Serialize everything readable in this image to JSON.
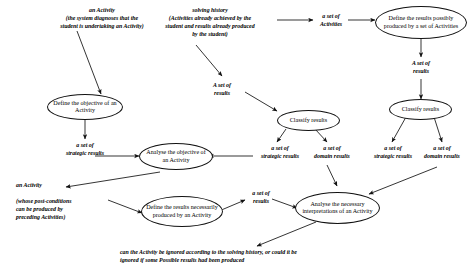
{
  "diagram": {
    "type": "flow-diagram",
    "stroke_color": "#111111",
    "background_color": "#ffffff",
    "nodes": [
      {
        "id": "define-objective",
        "label": "Define the objective\nof an Activity"
      },
      {
        "id": "define-possible-results",
        "label": "Define the results\npossibly produced by a\nset of Activities"
      },
      {
        "id": "classify-results-left",
        "label": "Classify results"
      },
      {
        "id": "classify-results-right",
        "label": "Classify results"
      },
      {
        "id": "analyse-objective",
        "label": "Analyse the objective\nof an Activity"
      },
      {
        "id": "define-necessary-results",
        "label": "Define the results\nnecessarily produced by\nan Activity"
      },
      {
        "id": "analyse-interpretations",
        "label": "Analyse the necessary\ninterpretations of an\nActivity"
      }
    ],
    "labels": [
      {
        "id": "an-activity-top",
        "text": "an Activity\n(the system diagnoses that the\nstudent is undertaking an Activity)"
      },
      {
        "id": "solving-history",
        "text": "solving history\n(Activities already achieved by the\nstudent and results already produced\nby the student)"
      },
      {
        "id": "a-set-of-activities",
        "text": "a set of\nActivities"
      },
      {
        "id": "a-set-of-results-mid",
        "text": "A set of\nresults"
      },
      {
        "id": "a-set-of-results-right",
        "text": "A set of\nresults"
      },
      {
        "id": "a-set-of-strategic-results-left",
        "text": "a set of\nstrategic results"
      },
      {
        "id": "a-set-of-strategic-results-mid",
        "text": "a set of\nstrategic results"
      },
      {
        "id": "a-set-of-domain-results-mid",
        "text": "a set of\ndomain results"
      },
      {
        "id": "a-set-of-strategic-results-right",
        "text": "a set of\nstrategic results"
      },
      {
        "id": "a-set-of-domain-results-right",
        "text": "a set of\ndomain results"
      },
      {
        "id": "an-activity-post-conditions",
        "text": "an Activity\n\n(whose post-conditions\ncan be produced by\npreceding Activities)"
      },
      {
        "id": "a-set-of-results-lower",
        "text": "a set of\nresults"
      },
      {
        "id": "ignore-question",
        "text": "can the Activity be ignored according to the solving history, or could it be\nignored if some Possible results had been produced"
      }
    ]
  }
}
